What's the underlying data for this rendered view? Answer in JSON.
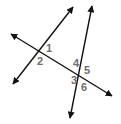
{
  "diagram": {
    "line_color": "#111111",
    "label_color": "#6e6e6e",
    "lines": [
      {
        "name": "transversal",
        "x1": 11,
        "y1": 34,
        "x2": 112,
        "y2": 96
      },
      {
        "name": "line-a",
        "x1": 13,
        "y1": 84,
        "x2": 73,
        "y2": 7
      },
      {
        "name": "line-b",
        "x1": 70,
        "y1": 118,
        "x2": 92,
        "y2": 6
      }
    ],
    "angle_labels": [
      {
        "text": "1",
        "x": 46,
        "y": 52
      },
      {
        "text": "2",
        "x": 37,
        "y": 65
      },
      {
        "text": "4",
        "x": 73,
        "y": 67
      },
      {
        "text": "5",
        "x": 84,
        "y": 74
      },
      {
        "text": "3",
        "x": 71,
        "y": 84
      },
      {
        "text": "6",
        "x": 81,
        "y": 91
      }
    ]
  }
}
